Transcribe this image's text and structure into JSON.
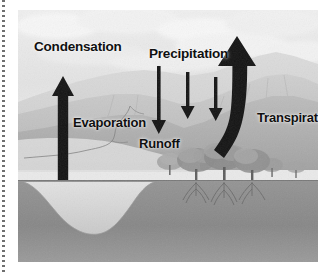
{
  "figure": {
    "medium": "grayscale illustration",
    "frame": {
      "x": 18,
      "y": 10,
      "width": 300,
      "height": 252
    }
  },
  "margin": {
    "rule_style": "dotted-vertical-line",
    "color": "#6f6f6f"
  },
  "labels": {
    "condensation": "Condensation",
    "precipitation": "Precipitation",
    "evaporation": "Evaporation",
    "runoff": "Runoff",
    "transpiration": "Transpiration"
  },
  "arrows": [
    {
      "name": "evaporation-arrow",
      "direction": "up",
      "label": "Evaporation"
    },
    {
      "name": "precipitation-arrow-1",
      "direction": "down",
      "label": "Precipitation"
    },
    {
      "name": "precipitation-arrow-2",
      "direction": "down",
      "label": "Precipitation"
    },
    {
      "name": "precipitation-arrow-3",
      "direction": "down",
      "label": "Precipitation"
    },
    {
      "name": "transpiration-arrow",
      "direction": "up",
      "label": "Transpiration"
    }
  ],
  "scene": {
    "sky": "overcast pale grey sky with clouds",
    "hills": "rolling hills and mountain ridges in background",
    "stream": "thin runoff stream channel in midground",
    "trees": "row of deciduous trees with visible root systems",
    "ground": "cross-section of soil below the surface",
    "water_body": "lake basin shown in subsurface cross-section"
  },
  "colors": {
    "sky": "#e8e8e8",
    "far_hills": "#d2d2d2",
    "mid_hills": "#bdbdbd",
    "near_hills": "#a8a8a8",
    "ground": "#8a8a8a",
    "subsoil": "#7b7b7b",
    "water": "#d8d8d8",
    "arrow": "#141414",
    "label_text": "#101010"
  }
}
